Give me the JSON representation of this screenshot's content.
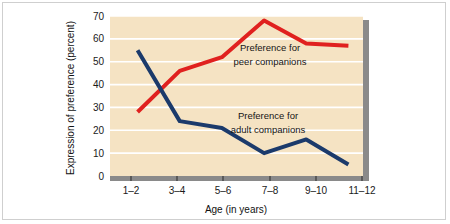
{
  "figure": {
    "background_color": "#ffffff",
    "border_color": "#cfcfcf"
  },
  "chart_data": {
    "type": "line",
    "title": "",
    "subtitle": "",
    "xlabel": "Age (in years)",
    "ylabel": "Expression of preference (percent)",
    "categories": [
      "1–2",
      "3–4",
      "5–6",
      "7–8",
      "9–10",
      "11–12"
    ],
    "ylim": [
      0,
      70
    ],
    "yticks": [
      "0",
      "10",
      "20",
      "30",
      "40",
      "50",
      "60",
      "70"
    ],
    "grid": "horizontal-white-gridlines",
    "legend": "inline-annotations",
    "plot_background_color": "#f5e3c3",
    "gridline_color": "#ffffff",
    "shadow_color": "#8a8a8a",
    "series": [
      {
        "name": "Preference for peer companions",
        "color": "#e0211f",
        "values": [
          28,
          46,
          52,
          68,
          58,
          57
        ]
      },
      {
        "name": "Preference for adult companions",
        "color": "#1b3a6b",
        "values": [
          55,
          24,
          21,
          10,
          16,
          5
        ]
      }
    ],
    "annotations": [
      {
        "id": "peer-annotation",
        "line1": "Preference for",
        "line2": "peer companions"
      },
      {
        "id": "adult-annotation",
        "line1": "Preference for",
        "line2": "adult companions"
      }
    ]
  }
}
